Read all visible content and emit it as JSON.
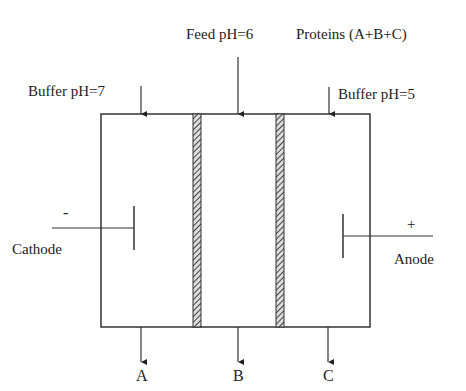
{
  "labels": {
    "feed": "Feed pH=6",
    "proteins": "Proteins (A+B+C)",
    "buffer_left": "Buffer pH=7",
    "buffer_right": "Buffer pH=5",
    "cathode_sign": "-",
    "cathode": "Cathode",
    "anode_sign": "+",
    "anode": "Anode",
    "out_a": "A",
    "out_b": "B",
    "out_c": "C"
  }
}
